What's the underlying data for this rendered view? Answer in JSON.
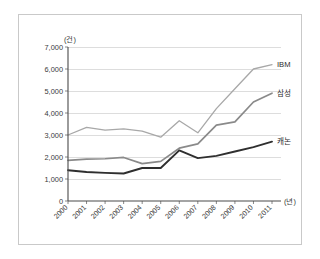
{
  "chart_data": {
    "type": "line",
    "title": "",
    "xlabel": "(년)",
    "ylabel": "(건)",
    "x": [
      "2000",
      "2001",
      "2002",
      "2003",
      "2004",
      "2005",
      "2006",
      "2007",
      "2008",
      "2009",
      "2010",
      "2011"
    ],
    "categories": [
      "2000",
      "2001",
      "2002",
      "2003",
      "2004",
      "2005",
      "2006",
      "2007",
      "2008",
      "2009",
      "2010",
      "2011"
    ],
    "ylim": [
      0,
      7000
    ],
    "yticks": [
      0,
      1000,
      2000,
      3000,
      4000,
      5000,
      6000,
      7000
    ],
    "ytick_labels": [
      "0",
      "1,000",
      "2,000",
      "3,000",
      "4,000",
      "5,000",
      "6,000",
      "7,000"
    ],
    "grid": true,
    "legend_position": "inline-right",
    "series": [
      {
        "name": "IBM",
        "color": "#a8a8a8",
        "width": 1.3,
        "values": [
          3000,
          3350,
          3220,
          3280,
          3180,
          2900,
          3650,
          3100,
          4200,
          5100,
          6000,
          6200
        ]
      },
      {
        "name": "삼성",
        "color": "#8a8a8a",
        "width": 1.7,
        "values": [
          1850,
          1900,
          1920,
          1980,
          1700,
          1800,
          2400,
          2600,
          3450,
          3600,
          4500,
          4900
        ]
      },
      {
        "name": "캐논",
        "color": "#2f2f2f",
        "width": 1.9,
        "values": [
          1400,
          1320,
          1280,
          1250,
          1500,
          1500,
          2300,
          1950,
          2050,
          2250,
          2450,
          2700
        ]
      }
    ]
  },
  "axes": {
    "y_unit_label": "(건)",
    "x_unit_label": "(년)"
  }
}
